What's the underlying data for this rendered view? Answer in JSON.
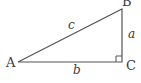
{
  "diagram": {
    "type": "right-triangle",
    "vertices": {
      "A": {
        "label": "A"
      },
      "B": {
        "label": "B"
      },
      "C": {
        "label": "C"
      }
    },
    "sides": {
      "a": {
        "label": "a"
      },
      "b": {
        "label": "b"
      },
      "c": {
        "label": "c"
      }
    },
    "right_angle_at": "C",
    "colors": {
      "stroke": "#555555",
      "text": "#3a3a3a",
      "background": "#ffffff"
    }
  }
}
